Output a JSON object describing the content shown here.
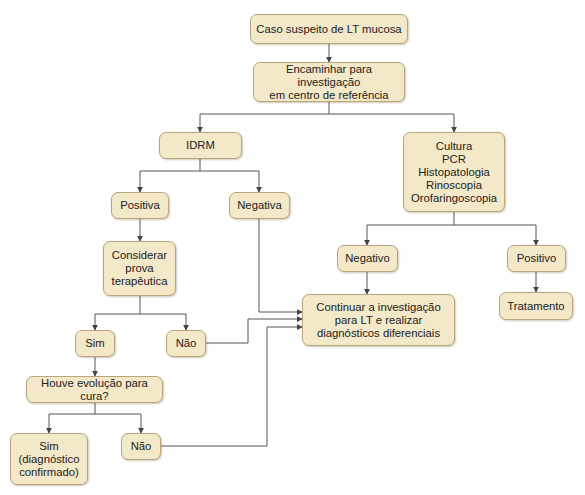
{
  "diagram": {
    "type": "flowchart",
    "colors": {
      "node_fill": "#f3e8c8",
      "node_border": "#b9a57a",
      "edge": "#555555",
      "text": "#222222"
    },
    "nodes": [
      {
        "id": "caso",
        "label": "Caso suspeito de LT mucosa",
        "x": 250,
        "y": 14,
        "w": 158,
        "h": 30
      },
      {
        "id": "encaminhar",
        "label": "Encaminhar para investigação\nem centro de referência",
        "x": 253,
        "y": 62,
        "w": 152,
        "h": 40
      },
      {
        "id": "idrm",
        "label": "IDRM",
        "x": 159,
        "y": 132,
        "w": 83,
        "h": 27
      },
      {
        "id": "cultura",
        "label": "Cultura\nPCR\nHistopatologia\nRinoscopia\nOrofaringoscopia",
        "x": 403,
        "y": 132,
        "w": 102,
        "h": 80
      },
      {
        "id": "positiva",
        "label": "Positiva",
        "x": 111,
        "y": 192,
        "w": 58,
        "h": 27
      },
      {
        "id": "negativa",
        "label": "Negativa",
        "x": 229,
        "y": 192,
        "w": 61,
        "h": 27
      },
      {
        "id": "considerar",
        "label": "Considerar\nprova\nterapêutica",
        "x": 103,
        "y": 241,
        "w": 73,
        "h": 55
      },
      {
        "id": "negativo",
        "label": "Negativo",
        "x": 337,
        "y": 245,
        "w": 61,
        "h": 27
      },
      {
        "id": "positivo",
        "label": "Positivo",
        "x": 507,
        "y": 245,
        "w": 59,
        "h": 27
      },
      {
        "id": "continuar",
        "label": "Continuar a investigação\npara LT e realizar\ndiagnósticos diferenciais",
        "x": 302,
        "y": 294,
        "w": 153,
        "h": 52
      },
      {
        "id": "tratamento",
        "label": "Tratamento",
        "x": 499,
        "y": 292,
        "w": 74,
        "h": 28
      },
      {
        "id": "sim1",
        "label": "Sim",
        "x": 75,
        "y": 330,
        "w": 40,
        "h": 27
      },
      {
        "id": "nao1",
        "label": "Não",
        "x": 166,
        "y": 330,
        "w": 40,
        "h": 27
      },
      {
        "id": "houve",
        "label": "Houve evolução para cura?",
        "x": 26,
        "y": 376,
        "w": 137,
        "h": 27
      },
      {
        "id": "sim2",
        "label": "Sim\n(diagnóstico\nconfirmado)",
        "x": 10,
        "y": 433,
        "w": 78,
        "h": 52
      },
      {
        "id": "nao2",
        "label": "Não",
        "x": 121,
        "y": 433,
        "w": 40,
        "h": 27
      }
    ],
    "edges": [
      {
        "from": "caso",
        "to": "encaminhar",
        "points": "329,44 329,62"
      },
      {
        "from": "encaminhar",
        "to": "idrm",
        "points": "329,102 329,114 200,114 200,132"
      },
      {
        "from": "encaminhar",
        "to": "cultura",
        "points": "329,114 454,114 454,132"
      },
      {
        "from": "idrm",
        "to": "positiva",
        "points": "200,159 200,171 140,171 140,192"
      },
      {
        "from": "idrm",
        "to": "negativa",
        "points": "200,171 259,171 259,192"
      },
      {
        "from": "positiva",
        "to": "considerar",
        "points": "140,219 140,241"
      },
      {
        "from": "cultura",
        "to": "negativo",
        "points": "454,212 454,225 367,225 367,245"
      },
      {
        "from": "cultura",
        "to": "positivo",
        "points": "454,225 536,225 536,245"
      },
      {
        "from": "negativo",
        "to": "continuar",
        "points": "367,272 367,294"
      },
      {
        "from": "positivo",
        "to": "tratamento",
        "points": "536,272 536,292"
      },
      {
        "from": "negativa",
        "to": "continuar",
        "points": "259,219 259,312 302,312"
      },
      {
        "from": "considerar",
        "to": "sim1",
        "points": "140,296 140,314 95,314 95,330"
      },
      {
        "from": "considerar",
        "to": "nao1",
        "points": "140,314 186,314 186,330"
      },
      {
        "from": "nao1",
        "to": "continuar",
        "points": "206,343 248,343 248,319 302,319"
      },
      {
        "from": "sim1",
        "to": "houve",
        "points": "95,357 95,376"
      },
      {
        "from": "houve",
        "to": "sim2",
        "points": "95,403 95,414 49,414 49,433"
      },
      {
        "from": "houve",
        "to": "nao2",
        "points": "95,414 141,414 141,433"
      },
      {
        "from": "nao2",
        "to": "continuar",
        "points": "161,446 267,446 267,327 302,327"
      }
    ]
  }
}
